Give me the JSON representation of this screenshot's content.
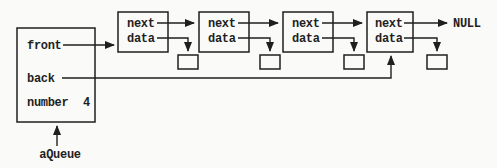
{
  "diagram": {
    "record": {
      "fields": [
        {
          "label": "front"
        },
        {
          "label": "back"
        },
        {
          "label": "number",
          "value": "4"
        }
      ],
      "variable_label": "aQueue"
    },
    "nodes": [
      {
        "next_label": "next",
        "data_label": "data"
      },
      {
        "next_label": "next",
        "data_label": "data"
      },
      {
        "next_label": "next",
        "data_label": "data"
      },
      {
        "next_label": "next",
        "data_label": "data"
      }
    ],
    "terminator_label": "NULL",
    "colors": {
      "ink": "#1f1f1f",
      "paper": "#fafaf8"
    }
  }
}
